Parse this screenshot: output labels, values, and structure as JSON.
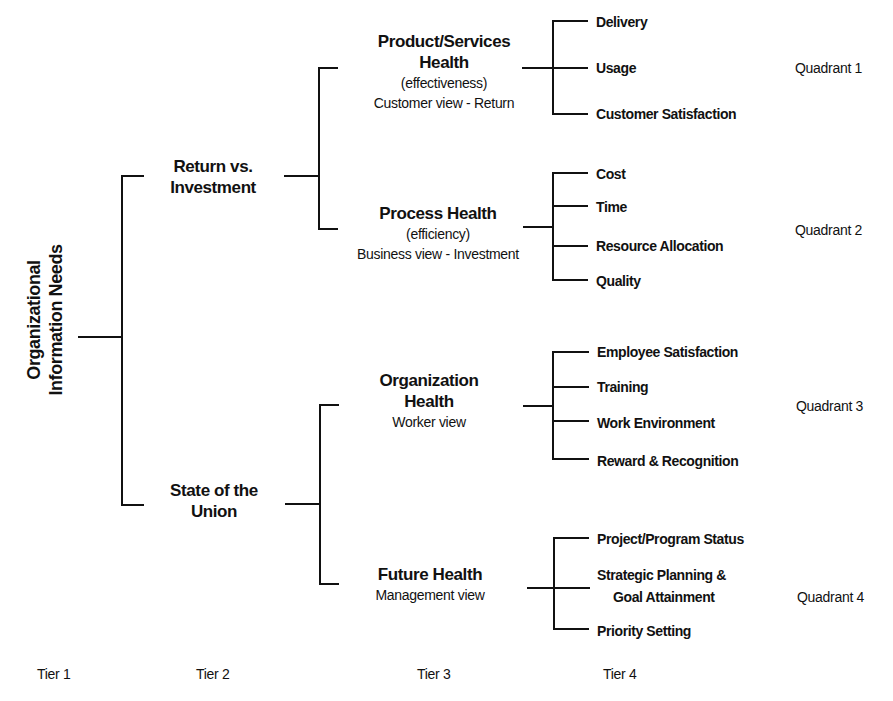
{
  "tier1": {
    "root": {
      "line1": "Organizational",
      "line2": "Information Needs"
    }
  },
  "tier2": [
    {
      "line1": "Return vs.",
      "line2": "Investment"
    },
    {
      "line1": "State of the",
      "line2": "Union"
    }
  ],
  "tier3": [
    {
      "line1": "Product/Services",
      "line2": "Health",
      "sub1": "(effectiveness)",
      "sub2": "Customer view - Return"
    },
    {
      "line1": "Process Health",
      "sub1": "(efficiency)",
      "sub2": "Business view - Investment"
    },
    {
      "line1": "Organization",
      "line2": "Health",
      "sub1": "Worker view"
    },
    {
      "line1": "Future Health",
      "sub1": "Management view"
    }
  ],
  "tier4": {
    "q1": [
      "Delivery",
      "Usage",
      "Customer Satisfaction"
    ],
    "q2": [
      "Cost",
      "Time",
      "Resource Allocation",
      "Quality"
    ],
    "q3": [
      "Employee Satisfaction",
      "Training",
      "Work Environment",
      "Reward & Recognition"
    ],
    "q4": [
      "Project/Program Status",
      "Strategic Planning &",
      "Goal Attainment",
      "Priority Setting"
    ]
  },
  "quadrants": [
    "Quadrant 1",
    "Quadrant 2",
    "Quadrant 3",
    "Quadrant 4"
  ],
  "tier_labels": [
    "Tier 1",
    "Tier 2",
    "Tier 3",
    "Tier 4"
  ]
}
